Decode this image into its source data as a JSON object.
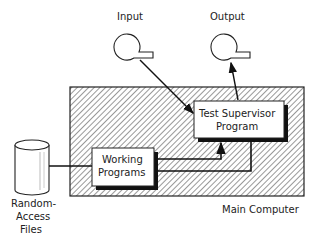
{
  "diagram": {
    "input_label": "Input",
    "output_label": "Output",
    "supervisor_line1": "Test Supervisor",
    "supervisor_line2": "Program",
    "working_line1": "Working",
    "working_line2": "Programs",
    "files_line1": "Random-",
    "files_line2": "Access",
    "files_line3": "Files",
    "container_label": "Main Computer"
  }
}
